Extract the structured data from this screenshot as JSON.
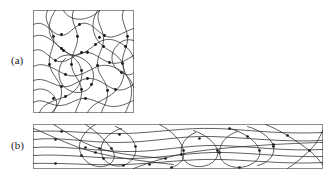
{
  "figure": {
    "caption_labels": {
      "panel_a": "(a)",
      "panel_b": "(b)"
    },
    "colors": {
      "background": "#ffffff",
      "frame_stroke": "#8c8c8c",
      "fiber_stroke": "#2b2b2b",
      "node_fill": "#1a1a1a",
      "label_text": "#1a1a1a"
    },
    "panels": [
      {
        "id": "panel-a",
        "label": "(a)",
        "description": "undeformed random fiber network in a square domain",
        "frame": {
          "x": 0,
          "y": 0,
          "width": 100,
          "height": 102
        },
        "fiber_count": 16,
        "node_count": 32
      },
      {
        "id": "panel-b",
        "label": "(b)",
        "description": "same fiber network stretched horizontally into a wide strip",
        "frame": {
          "x": 0,
          "y": 0,
          "width": 289,
          "height": 44
        },
        "fiber_count": 16,
        "node_count": 28
      }
    ]
  },
  "chart_data": {
    "type": "scatter",
    "title": "",
    "xlabel": "",
    "ylabel": "",
    "panel_a": {
      "frame": {
        "x": 0,
        "y": 0,
        "width": 100,
        "height": 102
      },
      "curves": [
        "M 0 14 C 10 9, 16 20, 24 24 C 33 28, 38 18, 46 14 C 56 9, 62 20, 71 25 C 80 30, 88 22, 100 18",
        "M 0 40 C 9 36, 14 46, 22 50 C 32 55, 40 44, 49 42 C 60 40, 66 49, 76 52 C 86 55, 93 49, 100 45",
        "M 0 70 C 10 66, 18 74, 28 76 C 39 78, 44 69, 54 68 C 66 67, 72 76, 82 79 C 90 81, 95 77, 100 74",
        "M 0 92 C 8 87, 15 94, 24 95 C 36 96, 42 87, 52 88 C 63 89, 70 96, 80 96 C 89 96, 95 92, 100 90",
        "M 14 0 C 9 10, 18 17, 20 26 C 22 36, 14 44, 16 54 C 18 65, 27 70, 28 80 C 29 90, 22 96, 20 102",
        "M 40 0 C 36 9, 43 16, 44 26 C 45 37, 37 43, 38 54 C 39 65, 47 69, 48 79 C 49 90, 43 96, 42 102",
        "M 66 0 C 61 10, 69 16, 70 27 C 71 38, 63 44, 64 55 C 65 66, 73 70, 74 80 C 75 91, 69 97, 68 102",
        "M 90 0 C 86 9, 93 16, 94 26 C 95 36, 88 43, 89 53 C 90 64, 97 68, 98 78 C 99 89, 94 96, 92 102",
        "M 0 26 C 12 21, 20 32, 30 40 C 42 50, 52 42, 62 34 C 72 26, 82 28, 92 36 C 97 40, 99 44, 100 48",
        "M 0 56 C 11 50, 22 60, 32 64 C 44 69, 54 60, 64 56 C 75 52, 86 58, 94 66 C 98 70, 99 74, 100 77",
        "M 6 102 C 10 92, 22 90, 32 86 C 44 81, 50 70, 48 60 C 46 49, 36 44, 28 38 C 20 32, 14 24, 16 14 C 17 7, 20 3, 22 0",
        "M 54 102 C 58 93, 70 90, 78 84 C 88 77, 92 66, 90 56 C 88 46, 78 42, 70 36 C 62 30, 58 20, 60 10 C 61 5, 63 2, 64 0",
        "M 100 30 C 92 27, 84 32, 80 40 C 76 49, 80 58, 88 62 C 95 66, 99 64, 100 62",
        "M 0 80 C 8 76, 18 80, 22 88 C 25 94, 22 99, 18 102",
        "M 30 0 C 34 8, 44 10, 52 8 C 60 6, 64 2, 66 0",
        "M 24 48 C 32 42, 44 44, 52 50 C 60 56, 62 66, 58 74 C 54 82, 44 84, 36 80 C 28 76, 24 68, 26 58 C 27 53, 29 50, 32 48"
      ],
      "nodes": [
        [
          20,
          26
        ],
        [
          28,
          24
        ],
        [
          44,
          26
        ],
        [
          46,
          14
        ],
        [
          66,
          27
        ],
        [
          71,
          25
        ],
        [
          22,
          50
        ],
        [
          30,
          40
        ],
        [
          38,
          54
        ],
        [
          48,
          42
        ],
        [
          54,
          42
        ],
        [
          64,
          55
        ],
        [
          76,
          52
        ],
        [
          89,
          53
        ],
        [
          94,
          26
        ],
        [
          16,
          54
        ],
        [
          28,
          38
        ],
        [
          32,
          64
        ],
        [
          48,
          60
        ],
        [
          62,
          34
        ],
        [
          70,
          36
        ],
        [
          88,
          62
        ],
        [
          28,
          76
        ],
        [
          32,
          86
        ],
        [
          48,
          79
        ],
        [
          54,
          68
        ],
        [
          58,
          74
        ],
        [
          74,
          80
        ],
        [
          82,
          79
        ],
        [
          20,
          88
        ],
        [
          52,
          88
        ],
        [
          92,
          36
        ]
      ]
    },
    "panel_b": {
      "frame": {
        "x": 0,
        "y": 0,
        "width": 289,
        "height": 44
      },
      "curves": [
        "M 0 7 C 30 5, 60 10, 92 9 C 124 8, 150 3, 182 4 C 214 5, 244 10, 289 8",
        "M 0 15 C 26 12, 52 18, 84 18 C 118 18, 146 11, 178 12 C 212 13, 248 18, 289 16",
        "M 0 23 C 28 21, 58 26, 90 27 C 124 28, 152 20, 186 21 C 220 22, 252 27, 289 25",
        "M 0 31 C 30 29, 62 34, 96 34 C 130 34, 158 27, 192 28 C 226 29, 256 33, 289 32",
        "M 0 39 C 26 38, 56 41, 90 40 C 126 39, 154 34, 188 35 C 222 36, 254 40, 289 38",
        "M 0 4 C 20 12, 38 22, 62 28 C 86 34, 112 37, 140 40",
        "M 20 0 C 34 8, 46 18, 66 24 C 86 30, 108 32, 132 34",
        "M 52 0 C 62 6, 70 14, 78 24 C 84 32, 80 40, 70 42 C 62 43, 56 40, 52 36 C 46 30, 44 22, 48 14 C 51 8, 56 3, 62 0",
        "M 82 2 C 92 6, 100 14, 102 22 C 104 30, 98 38, 90 41 C 82 43, 74 40, 70 34 C 65 26, 68 16, 76 10 C 80 7, 84 5, 88 4",
        "M 126 0 C 138 6, 148 16, 150 26 C 152 34, 146 41, 138 43",
        "M 160 6 C 172 10, 182 18, 184 26 C 186 34, 178 41, 168 42 C 158 43, 150 38, 148 30 C 146 21, 152 12, 162 8",
        "M 196 4 C 212 8, 224 18, 226 26 C 228 35, 218 42, 206 43 C 194 43, 186 37, 186 28 C 186 18, 194 10, 204 7",
        "M 214 2 C 228 6, 238 14, 240 22 C 242 31, 234 39, 224 41",
        "M 232 0 C 248 6, 262 16, 276 26 C 282 31, 286 36, 289 40",
        "M 254 44 C 264 38, 272 30, 280 22 C 284 17, 287 12, 289 6",
        "M 100 44 C 116 38, 134 32, 156 28 C 180 24, 210 22, 240 20 C 262 19, 278 18, 289 18"
      ],
      "nodes": [
        [
          22,
          15
        ],
        [
          22,
          39
        ],
        [
          28,
          7
        ],
        [
          48,
          31
        ],
        [
          52,
          23
        ],
        [
          62,
          28
        ],
        [
          66,
          24
        ],
        [
          70,
          34
        ],
        [
          78,
          24
        ],
        [
          86,
          10
        ],
        [
          90,
          41
        ],
        [
          102,
          22
        ],
        [
          116,
          40
        ],
        [
          132,
          34
        ],
        [
          138,
          43
        ],
        [
          148,
          30
        ],
        [
          150,
          26
        ],
        [
          166,
          14
        ],
        [
          184,
          26
        ],
        [
          186,
          28
        ],
        [
          196,
          4
        ],
        [
          206,
          43
        ],
        [
          214,
          12
        ],
        [
          226,
          26
        ],
        [
          240,
          20
        ],
        [
          240,
          22
        ],
        [
          254,
          11
        ],
        [
          276,
          26
        ]
      ]
    }
  }
}
